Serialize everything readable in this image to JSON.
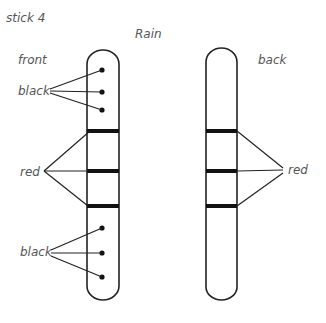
{
  "title": "stick 4",
  "subtitle": "Rain",
  "front": {
    "label": "front",
    "top_label": "black",
    "middle_label": "red",
    "bottom_label": "black",
    "top_dots": 3,
    "bands": 3,
    "bottom_dots": 3
  },
  "back": {
    "label": "back",
    "band_label": "red",
    "bands": 3
  },
  "colors": {
    "ink": "#222222",
    "label": "#555555",
    "background": "#ffffff"
  }
}
